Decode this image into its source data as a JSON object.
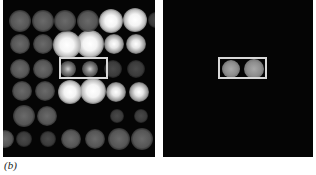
{
  "figure": {
    "label": "(b)",
    "background_color": "#050505",
    "box_color": "#d8d8d8"
  },
  "left_panel": {
    "name": "spot-grid-image",
    "rows": 6,
    "columns_visible": 7,
    "roi": {
      "row": 3,
      "columns": [
        3,
        4
      ],
      "description": "white rectangle around two spots"
    },
    "spots": [
      {
        "x": 17,
        "y": 21,
        "r": 11,
        "type": "dim"
      },
      {
        "x": 40,
        "y": 21,
        "r": 11,
        "type": "dim"
      },
      {
        "x": 62,
        "y": 21,
        "r": 11,
        "type": "dim"
      },
      {
        "x": 85,
        "y": 21,
        "r": 11,
        "type": "dim"
      },
      {
        "x": 108,
        "y": 21,
        "r": 12,
        "type": "bright"
      },
      {
        "x": 132,
        "y": 20,
        "r": 12,
        "type": "bright"
      },
      {
        "x": 153,
        "y": 20,
        "r": 8,
        "type": "faint"
      },
      {
        "x": 17,
        "y": 44,
        "r": 10,
        "type": "dim"
      },
      {
        "x": 40,
        "y": 44,
        "r": 10,
        "type": "dim"
      },
      {
        "x": 64,
        "y": 45,
        "r": 14,
        "type": "bright"
      },
      {
        "x": 87,
        "y": 44,
        "r": 14,
        "type": "bright"
      },
      {
        "x": 111,
        "y": 44,
        "r": 10,
        "type": "mid"
      },
      {
        "x": 133,
        "y": 44,
        "r": 10,
        "type": "mid"
      },
      {
        "x": 17,
        "y": 69,
        "r": 10,
        "type": "dim"
      },
      {
        "x": 40,
        "y": 69,
        "r": 10,
        "type": "dim"
      },
      {
        "x": 65,
        "y": 69,
        "r": 8,
        "type": "target"
      },
      {
        "x": 87,
        "y": 69,
        "r": 8,
        "type": "target"
      },
      {
        "x": 110,
        "y": 69,
        "r": 9,
        "type": "faint"
      },
      {
        "x": 133,
        "y": 69,
        "r": 9,
        "type": "faint"
      },
      {
        "x": 19,
        "y": 91,
        "r": 10,
        "type": "dim"
      },
      {
        "x": 42,
        "y": 91,
        "r": 10,
        "type": "dim"
      },
      {
        "x": 67,
        "y": 92,
        "r": 12,
        "type": "bright"
      },
      {
        "x": 90,
        "y": 91,
        "r": 13,
        "type": "bright"
      },
      {
        "x": 113,
        "y": 92,
        "r": 10,
        "type": "mid"
      },
      {
        "x": 136,
        "y": 92,
        "r": 10,
        "type": "mid"
      },
      {
        "x": 21,
        "y": 116,
        "r": 11,
        "type": "dim"
      },
      {
        "x": 44,
        "y": 116,
        "r": 10,
        "type": "dim"
      },
      {
        "x": 114,
        "y": 116,
        "r": 7,
        "type": "faint"
      },
      {
        "x": 138,
        "y": 116,
        "r": 7,
        "type": "faint"
      },
      {
        "x": 2,
        "y": 139,
        "r": 9,
        "type": "dim"
      },
      {
        "x": 21,
        "y": 139,
        "r": 8,
        "type": "faint"
      },
      {
        "x": 45,
        "y": 139,
        "r": 8,
        "type": "faint"
      },
      {
        "x": 68,
        "y": 139,
        "r": 10,
        "type": "dim"
      },
      {
        "x": 92,
        "y": 139,
        "r": 10,
        "type": "dim"
      },
      {
        "x": 116,
        "y": 139,
        "r": 11,
        "type": "dim"
      },
      {
        "x": 139,
        "y": 139,
        "r": 11,
        "type": "dim"
      }
    ]
  },
  "right_panel": {
    "name": "isolated-pair-image",
    "roi": {
      "description": "white rectangle around the two remaining spots"
    },
    "spots": [
      {
        "x": 68,
        "y": 69,
        "r": 9,
        "type": "isolated"
      },
      {
        "x": 91,
        "y": 69,
        "r": 10,
        "type": "isolated"
      }
    ]
  }
}
